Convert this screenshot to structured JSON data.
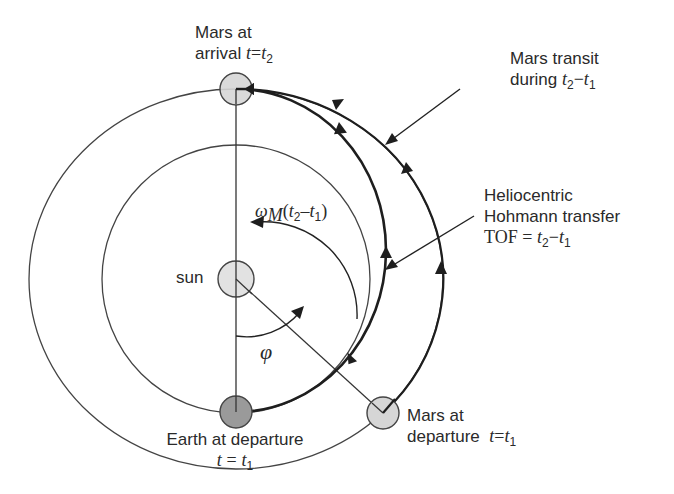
{
  "diagram": {
    "bodies": {
      "sun": {
        "label": "sun",
        "cx": 236,
        "cy": 279,
        "r": 18,
        "fill": "#e2e2e2"
      },
      "earth_departure": {
        "label_line1": "Earth at departure",
        "label_eq_var": "t",
        "label_eq_sign": "=",
        "label_eq_val": "t",
        "label_eq_sub": "1",
        "cx": 236,
        "cy": 412,
        "r": 16,
        "fill": "#9a9a9a"
      },
      "mars_arrival": {
        "label_line1": "Mars at",
        "label_line2": "arrival",
        "label_eq_var": "t",
        "label_eq_sign": "=",
        "label_eq_val": "t",
        "label_eq_sub": "2",
        "cx": 236,
        "cy": 89,
        "r": 16,
        "fill": "#d6d6d6"
      },
      "mars_departure": {
        "label_line1": "Mars at",
        "label_line2": "departure",
        "label_eq_var": "t",
        "label_eq_sign": "=",
        "label_eq_val": "t",
        "label_eq_sub": "1",
        "cx": 383,
        "cy": 413,
        "r": 16,
        "fill": "#d6d6d6"
      }
    },
    "orbits": {
      "earth_orbit": {
        "rx": 134,
        "ry": 134
      },
      "mars_orbit": {
        "rx": 207,
        "ry": 190
      }
    },
    "annotations": {
      "mars_transit": {
        "line1": "Mars transit",
        "line2_prefix": "during",
        "t2": "t",
        "t2_sub": "2",
        "minus": "−",
        "t1": "t",
        "t1_sub": "1"
      },
      "hohmann": {
        "line1": "Heliocentric",
        "line2": "Hohmann transfer",
        "tof": "TOF",
        "eq": "=",
        "t2": "t",
        "t2_sub": "2",
        "minus": "−",
        "t1": "t",
        "t1_sub": "1"
      },
      "omega_angle": {
        "omega": "ω",
        "omega_sub": "M",
        "open": "(",
        "t2": "t",
        "t2_sub": "2",
        "minus": "–",
        "t1": "t",
        "t1_sub": "1",
        "close": ")"
      },
      "phi_angle": {
        "symbol": "φ"
      }
    },
    "colors": {
      "line": "#333333",
      "heavy": "#1e1e1e",
      "text": "#2a2a2a"
    }
  }
}
